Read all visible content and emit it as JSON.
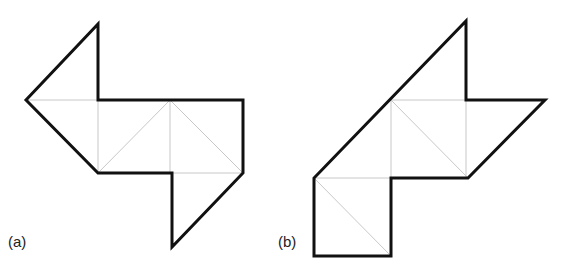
{
  "figure": {
    "panels": [
      {
        "label": "(a)",
        "outline": [
          [
            98,
            24
          ],
          [
            98,
            100
          ],
          [
            243,
            100
          ],
          [
            243,
            173
          ],
          [
            172,
            247
          ],
          [
            172,
            173
          ],
          [
            98,
            173
          ],
          [
            26,
            100
          ]
        ],
        "inner_lines": [
          [
            [
              26,
              100
            ],
            [
              98,
              100
            ]
          ],
          [
            [
              98,
              100
            ],
            [
              98,
              173
            ]
          ],
          [
            [
              98,
              173
            ],
            [
              170,
              100
            ]
          ],
          [
            [
              170,
              100
            ],
            [
              170,
              173
            ]
          ],
          [
            [
              170,
              100
            ],
            [
              243,
              173
            ]
          ],
          [
            [
              172,
              173
            ],
            [
              243,
              173
            ]
          ]
        ]
      },
      {
        "label": "(b)",
        "outline": [
          [
            466,
            21
          ],
          [
            466,
            100
          ],
          [
            545,
            100
          ],
          [
            468,
            178
          ],
          [
            391,
            178
          ],
          [
            391,
            256
          ],
          [
            314,
            256
          ],
          [
            314,
            178
          ]
        ],
        "inner_lines": [
          [
            [
              391,
              100
            ],
            [
              466,
              100
            ]
          ],
          [
            [
              391,
              100
            ],
            [
              391,
              178
            ]
          ],
          [
            [
              391,
              100
            ],
            [
              468,
              178
            ]
          ],
          [
            [
              466,
              100
            ],
            [
              466,
              178
            ]
          ],
          [
            [
              314,
              178
            ],
            [
              391,
              178
            ]
          ],
          [
            [
              314,
              178
            ],
            [
              391,
              256
            ]
          ]
        ]
      }
    ],
    "colors": {
      "outline": "#111111",
      "inner": "#c8c8c8"
    }
  }
}
